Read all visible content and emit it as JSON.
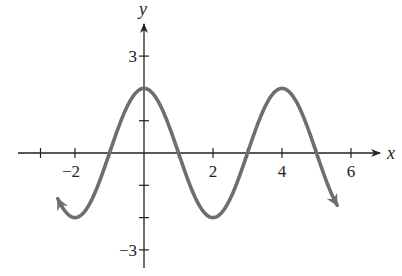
{
  "chart_data": {
    "type": "line",
    "title": "",
    "xlabel": "x",
    "ylabel": "y",
    "function": "y = 2cos(pi x / 2)",
    "xlim": [
      -3.5,
      7
    ],
    "ylim": [
      -3.5,
      3.8
    ],
    "x_ticks": [
      -3,
      -2,
      -1,
      1,
      2,
      3,
      4,
      5,
      6
    ],
    "x_tick_labels": [
      {
        "value": -2,
        "label": "−2"
      },
      {
        "value": 2,
        "label": "2"
      },
      {
        "value": 4,
        "label": "4"
      },
      {
        "value": 6,
        "label": "6"
      }
    ],
    "y_ticks": [
      -3,
      -2,
      -1,
      1,
      2,
      3
    ],
    "y_tick_labels": [
      {
        "value": 3,
        "label": "3"
      },
      {
        "value": -3,
        "label": "−3"
      }
    ],
    "grid": false,
    "legend": null,
    "series": [
      {
        "name": "curve",
        "color": "#6e6e6e",
        "x": [
          -2.5,
          -2,
          -1,
          0,
          1,
          2,
          3,
          4,
          5,
          5.6
        ],
        "y": [
          -1.41,
          -2,
          0,
          2,
          0,
          -2,
          0,
          2,
          0,
          -1.18
        ],
        "arrows": [
          "start",
          "end"
        ]
      }
    ],
    "key_points": {
      "maxima": [
        [
          0,
          2
        ],
        [
          4,
          2
        ]
      ],
      "minima": [
        [
          -2,
          -2
        ],
        [
          2,
          -2
        ]
      ],
      "zeros": [
        -1,
        1,
        3,
        5
      ]
    }
  },
  "axes": {
    "x_label": "x",
    "y_label": "y"
  }
}
